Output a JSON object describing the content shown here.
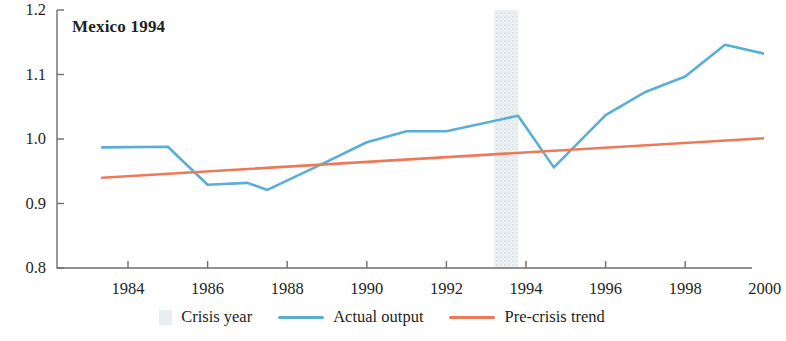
{
  "chart_data": {
    "type": "line",
    "title": "Mexico 1994",
    "xlabel": "",
    "ylabel": "",
    "xlim": [
      1983.0,
      2000.6
    ],
    "ylim": [
      0.8,
      1.2
    ],
    "grid": false,
    "legend_position": "bottom",
    "x_ticks": [
      1984,
      1986,
      1988,
      1990,
      1992,
      1994,
      1996,
      1998,
      2000
    ],
    "x_tick_labels": [
      "1984",
      "1986",
      "1988",
      "1990",
      "1992",
      "1994",
      "1996",
      "1998",
      "2000"
    ],
    "y_ticks": [
      0.8,
      0.9,
      1.0,
      1.1,
      1.2
    ],
    "y_tick_labels": [
      "0.8",
      "0.9",
      "1.0",
      "1.1",
      "1.2"
    ],
    "crisis_band": {
      "label": "Crisis year",
      "start": 1993.2,
      "end": 1993.8,
      "color": "#e9eef1"
    },
    "series": [
      {
        "name": "Actual output",
        "color": "#5aaed6",
        "x": [
          1983.35,
          1985.0,
          1986.0,
          1987.0,
          1987.5,
          1989.0,
          1990.0,
          1991.0,
          1992.0,
          1993.8,
          1994.7,
          1996.0,
          1997.0,
          1998.0,
          1999.0,
          2000.3
        ],
        "values": [
          0.987,
          0.988,
          0.929,
          0.932,
          0.921,
          0.965,
          0.995,
          1.012,
          1.012,
          1.036,
          0.956,
          1.037,
          1.073,
          1.097,
          1.146,
          1.128
        ]
      },
      {
        "name": "Pre-crisis trend",
        "color": "#ec7a58",
        "x": [
          1983.35,
          2000.45
        ],
        "values": [
          0.94,
          1.003
        ]
      }
    ]
  },
  "legend": {
    "items": [
      {
        "label": "Crisis year",
        "marker": "band",
        "color": "#e9eef1"
      },
      {
        "label": "Actual output",
        "marker": "line",
        "color": "#5aaed6"
      },
      {
        "label": "Pre-crisis trend",
        "marker": "line",
        "color": "#ec7a58"
      }
    ]
  },
  "axis": {
    "color": "#6d6e70"
  }
}
